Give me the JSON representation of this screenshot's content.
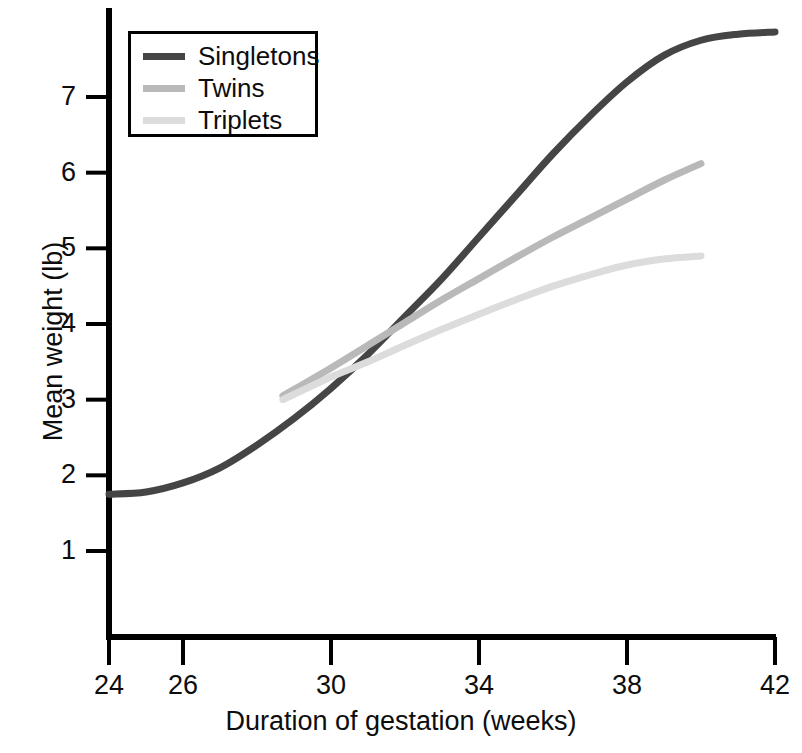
{
  "chart_data": {
    "type": "line",
    "title": "",
    "xlabel": "Duration of gestation (weeks)",
    "ylabel": "Mean weight (lb)",
    "xlim": [
      24,
      42
    ],
    "ylim": [
      0,
      8.2
    ],
    "xticks": [
      24,
      26,
      30,
      34,
      38,
      42
    ],
    "yticks": [
      1,
      2,
      3,
      4,
      5,
      6,
      7
    ],
    "grid": false,
    "legend_position": "top-left",
    "series": [
      {
        "name": "Singletons",
        "color": "#454545",
        "x": [
          24,
          25,
          26,
          27,
          28,
          29,
          30,
          31,
          32,
          33,
          34,
          35,
          36,
          37,
          38,
          39,
          40,
          41,
          42
        ],
        "values": [
          1.75,
          1.78,
          1.9,
          2.1,
          2.4,
          2.75,
          3.15,
          3.6,
          4.1,
          4.6,
          5.15,
          5.7,
          6.25,
          6.75,
          7.2,
          7.55,
          7.75,
          7.83,
          7.86
        ]
      },
      {
        "name": "Twins",
        "color": "#b9b9b9",
        "x": [
          28.7,
          30,
          31,
          32,
          33,
          34,
          35,
          36,
          37,
          38,
          39,
          40
        ],
        "values": [
          3.05,
          3.42,
          3.72,
          4.02,
          4.32,
          4.6,
          4.88,
          5.15,
          5.4,
          5.65,
          5.9,
          6.12
        ]
      },
      {
        "name": "Triplets",
        "color": "#dcdcdc",
        "x": [
          28.7,
          30,
          31,
          32,
          33,
          34,
          35,
          36,
          37,
          38,
          39,
          40
        ],
        "values": [
          3.0,
          3.3,
          3.5,
          3.72,
          3.93,
          4.13,
          4.32,
          4.5,
          4.65,
          4.78,
          4.86,
          4.9
        ]
      }
    ]
  },
  "legend": {
    "items": [
      {
        "label": "Singletons",
        "color": "#454545"
      },
      {
        "label": "Twins",
        "color": "#b9b9b9"
      },
      {
        "label": "Triplets",
        "color": "#dcdcdc"
      }
    ]
  },
  "axes": {
    "x_title": "Duration of gestation (weeks)",
    "y_title": "Mean weight (lb)",
    "x_tick_labels": [
      "24",
      "26",
      "30",
      "34",
      "38",
      "42"
    ],
    "y_tick_labels": [
      "1",
      "2",
      "3",
      "4",
      "5",
      "6",
      "7"
    ],
    "axis_color": "#000000"
  }
}
